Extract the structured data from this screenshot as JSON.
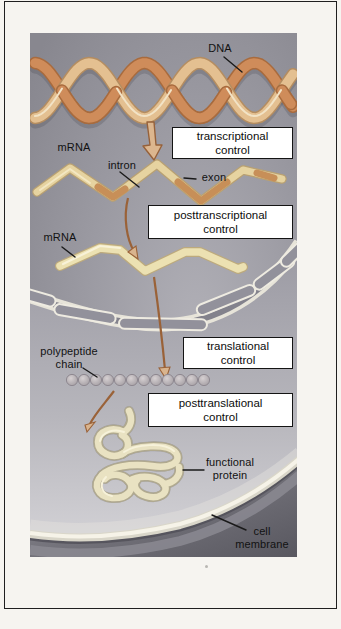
{
  "figure": {
    "labels": {
      "dna": "DNA",
      "mrna_primary": "mRNA",
      "intron": "intron",
      "exon": "exon",
      "mrna_mature": "mRNA",
      "polypeptide": {
        "line1": "polypeptide",
        "line2": "chain"
      },
      "functional_protein": {
        "line1": "functional",
        "line2": "protein"
      },
      "cell_membrane": {
        "line1": "cell",
        "line2": "membrane"
      }
    },
    "control_boxes": [
      {
        "line1": "transcriptional",
        "line2": "control"
      },
      {
        "line1": "posttranscriptional",
        "line2": "control"
      },
      {
        "line1": "translational",
        "line2": "control"
      },
      {
        "line1": "posttranslational",
        "line2": "control"
      }
    ],
    "colors": {
      "page_bg": "#f6f4f0",
      "frame_border": "#1f1f1f",
      "nucleus_bg": "#8e8d95",
      "cytoplasm_bg": "#a5a4ac",
      "cell_exterior": "#63626a",
      "dna_strand_front": "#cf8c5a",
      "dna_strand_front_edge": "#a86b3e",
      "dna_strand_back": "#e4c091",
      "dna_strand_back_edge": "#b58d60",
      "mrna_cream": "#e6d3a0",
      "mrna_mature_cream": "#ece1b2",
      "intron_orange": "#c78f58",
      "arrow_outline": "#9a6238",
      "arrow_fill": "#dcb68e",
      "nuclear_pore_fill": "#92919b",
      "nuclear_pore_edge": "#eeebe1",
      "bead": "#b7b0b4",
      "protein_tube": "#e9e2c2",
      "membrane_band": "#f6f3e8",
      "box_bg": "#ffffff",
      "box_border": "#141414",
      "label_text": "#121212"
    }
  }
}
